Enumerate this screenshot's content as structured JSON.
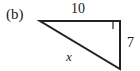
{
  "figure": {
    "part_label": "(b)",
    "shape": "right-triangle",
    "labels": {
      "top_side": "10",
      "right_side": "7",
      "hypotenuse": "x"
    },
    "right_angle_marker": "right-angle-square",
    "colors": {
      "stroke": "#222222",
      "fill": "#ffffff",
      "text": "#1a1a1a",
      "background": "#ffffff"
    },
    "geometry": {
      "vertex_top_left": [
        40,
        21
      ],
      "vertex_top_right": [
        120,
        21
      ],
      "vertex_bottom_right": [
        120,
        69
      ]
    }
  }
}
